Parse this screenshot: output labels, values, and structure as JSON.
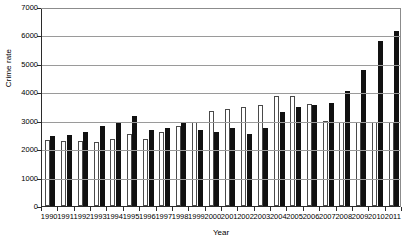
{
  "chart_data": {
    "type": "bar",
    "title": "",
    "xlabel": "Year",
    "ylabel": "Crime rate",
    "ylim": [
      0,
      7000
    ],
    "yticks": [
      0,
      1000,
      2000,
      3000,
      4000,
      5000,
      6000,
      7000
    ],
    "ytick_labels": [
      "0",
      "1000",
      "2000",
      "3000",
      "4000",
      "5000",
      "6000",
      "7000"
    ],
    "grid": true,
    "legend": "none",
    "categories": [
      "1990",
      "1991",
      "1992",
      "1993",
      "1994",
      "1995",
      "1996",
      "1997",
      "1998",
      "1999",
      "2000",
      "2001",
      "2002",
      "2003",
      "2004",
      "2005",
      "2006",
      "2007",
      "2008",
      "2009",
      "2010",
      "2011"
    ],
    "series": [
      {
        "name": "series-a",
        "style": "hollow-white-bar",
        "color": "#ffffff",
        "edge_color": "#4a4a4a",
        "values": [
          2320,
          2270,
          2300,
          2240,
          2370,
          2540,
          2340,
          2600,
          2800,
          2940,
          3340,
          3420,
          3500,
          3560,
          3860,
          3870,
          3600,
          3000,
          2940,
          2960,
          2950,
          2960
        ]
      },
      {
        "name": "series-b",
        "style": "solid-black-bar",
        "color": "#111111",
        "values": [
          2450,
          2510,
          2600,
          2820,
          2930,
          3160,
          2670,
          2740,
          2950,
          2680,
          2600,
          2760,
          2540,
          2760,
          3300,
          3470,
          3550,
          3620,
          4030,
          4800,
          5800,
          6150
        ]
      }
    ]
  }
}
